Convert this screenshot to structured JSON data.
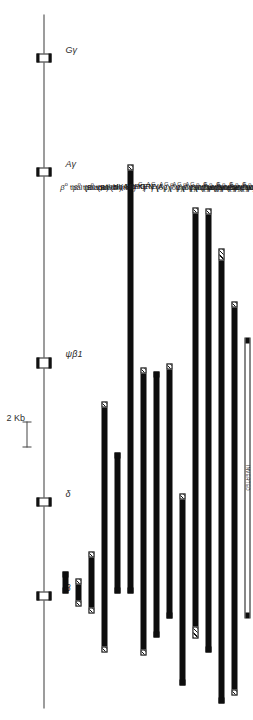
{
  "figure": {
    "scale": {
      "label": "2 Kb",
      "kb": 2
    }
  },
  "axis": {
    "name": "globin-gene-axis",
    "genes": [
      {
        "id": "g-gamma",
        "label": "Gγ",
        "sup": ""
      },
      {
        "id": "a-gamma",
        "label": "Aγ",
        "sup": ""
      },
      {
        "id": "psi-beta1",
        "label": "ψβ1",
        "sup": ""
      },
      {
        "id": "delta",
        "label": "δ",
        "sup": ""
      },
      {
        "id": "beta",
        "label": "β",
        "sup": ""
      }
    ]
  },
  "chart_data": {
    "type": "bar",
    "orientation": "horizontal-rotated",
    "xlabel": "Gene cluster position (kb)",
    "ylabel": "",
    "scale_bar_kb": 2,
    "gene_positions_kb": [
      0.0,
      4.9,
      13.1,
      21.8,
      27.6
    ],
    "gene_names": [
      "Gγ",
      "Aγ",
      "ψβ1",
      "δ",
      "β"
    ],
    "categories": [
      "β° thal (Black)",
      "β° thal (Black)",
      "β° thal (Dutch)",
      "γ thal (Asian)",
      "Hb LEPORE",
      "Hb KENYA",
      "GγAγ(δβ)° thal (Sicilian)",
      "GγAγ(δβ)° thal (Japanese)",
      "GγAγ(δβ)° thal (Black)",
      "GγAγ(δβ)° thal (Greek)",
      "Gγ(Aγδβ)° thal (Turkish)",
      "Gγ(Aγδβ)° thal (Malaysian)",
      "Gγ(Aγδβ)° thal (German)",
      "Gγ(Aγδβ)° thal (Black)",
      "Gγ(Aγδβ)° thal (Indian)"
    ],
    "values_kb": [
      1.6,
      1.2,
      2.6,
      15.1,
      7.6,
      22.9,
      15.4,
      14.2,
      13.6,
      20.6,
      23.4,
      34.8,
      37.7,
      32.6,
      23.2
    ]
  },
  "rows": [
    {
      "name": "row-beta0-thal-black-1",
      "label_html": "<i>β</i><sup>o</sup> thal (Black)",
      "label_text": "β° thal (Black)",
      "start_kb": 25.9,
      "end_kb": 27.5,
      "left_end": "solid",
      "right_end": "solid",
      "style": "filled"
    },
    {
      "name": "row-beta0-thal-black-2",
      "label_html": "<i>β</i><sup>o</sup> thal (Black)",
      "label_text": "β° thal (Black)",
      "start_kb": 26.4,
      "end_kb": 27.6,
      "left_end": "hatch",
      "right_end": "hatch",
      "style": "filled"
    },
    {
      "name": "row-beta0-thal-dutch",
      "label_html": "<i>β</i><sup>o</sup> thal (Dutch)",
      "label_text": "β° thal (Dutch)",
      "start_kb": 25.0,
      "end_kb": 27.6,
      "left_end": "hatch",
      "right_end": "hatch",
      "style": "filled"
    },
    {
      "name": "row-gamma-thal-asian",
      "label_html": "<i>γ</i> thal (Asian)",
      "label_text": "γ thal (Asian)",
      "start_kb": 18.0,
      "end_kb": 33.1,
      "left_end": "hatch",
      "right_end": "hatch",
      "style": "filled"
    },
    {
      "name": "row-hb-lepore",
      "label_html": "Hb LEPORE",
      "label_text": "Hb LEPORE",
      "start_kb": 20.0,
      "end_kb": 27.6,
      "left_end": "solid",
      "right_end": "solid",
      "style": "filled"
    },
    {
      "name": "row-hb-kenya",
      "label_html": "Hb KENYA",
      "label_text": "Hb KENYA",
      "start_kb": 4.7,
      "end_kb": 27.6,
      "left_end": "hatch",
      "right_end": "solid",
      "style": "filled"
    },
    {
      "name": "row-ggag-db-sicilian",
      "label_html": "<sup>G</sup>γ<sup>A</sup>γ (δβ)<sup>o</sup> thal (Sicilian)",
      "label_text": "GγAγ (δβ)° thal (Sicilian)",
      "start_kb": 16.4,
      "end_kb": 31.8,
      "left_end": "hatch",
      "right_end": "hatch",
      "style": "filled"
    },
    {
      "name": "row-ggag-db-japanese",
      "label_html": "<sup>G</sup>γ<sup>A</sup>γ (δβ)<sup>o</sup> thal (Japanese)",
      "label_text": "GγAγ (δβ)° thal (Japanese)",
      "start_kb": 16.6,
      "end_kb": 30.8,
      "left_end": "solid",
      "right_end": "solid",
      "style": "filled"
    },
    {
      "name": "row-ggag-db-black",
      "label_html": "<sup>G</sup>γ<sup>A</sup>γ (δβ)<sup>o</sup> thal (Black)",
      "label_text": "GγAγ (δβ)° thal (Black)",
      "start_kb": 16.2,
      "end_kb": 29.8,
      "left_end": "hatch",
      "right_end": "solid",
      "style": "filled"
    },
    {
      "name": "row-ggag-db-greek",
      "label_html": "<sup>G</sup>γ<sup>A</sup>γ (δβ)<sup>o</sup> thal (Greek)",
      "label_text": "GγAγ (δβ)° thal (Greek)",
      "start_kb": 22.4,
      "end_kb": 43.0,
      "left_end": "hatch",
      "right_end": "solid",
      "style": "filled"
    },
    {
      "name": "row-gg-agdb-turkish",
      "label_html": "<sup>G</sup>γ (<sup>A</sup>γδβ)<sup>o</sup> thal (Turkish)",
      "label_text": "Gγ (Aγδβ)° thal (Turkish)",
      "start_kb": 7.0,
      "end_kb": 30.4,
      "left_end": "hatch",
      "right_end": "hatch-long",
      "style": "filled"
    },
    {
      "name": "row-gg-agdb-malaysian",
      "label_html": "<sup>G</sup>γ (<sup>A</sup>γδβ)<sup>o</sup> thal (Malaysian)",
      "label_text": "Gγ (Aγδβ)° thal (Malaysian)",
      "start_kb": 7.0,
      "end_kb": 41.8,
      "left_end": "hatch",
      "right_end": "solid",
      "style": "filled"
    },
    {
      "name": "row-gg-agdb-german",
      "label_html": "<sup>G</sup>γ (<sup>A</sup>γδβ)<sup>o</sup> thal (German)",
      "label_text": "Gγ (Aγδβ)° thal (German)",
      "start_kb": 9.2,
      "end_kb": 46.9,
      "left_end": "hatch-long",
      "right_end": "solid",
      "style": "filled"
    },
    {
      "name": "row-gg-agdb-black",
      "label_html": "<sup>G</sup>γ (<sup>A</sup>γδβ)<sup>o</sup> thal (Black)",
      "label_text": "Gγ (Aγδβ)° thal (Black)",
      "start_kb": 12.1,
      "end_kb": 44.7,
      "left_end": "hatch",
      "right_end": "hatch",
      "style": "filled"
    },
    {
      "name": "row-gg-agdb-indian",
      "label_html": "<sup>G</sup>γ (<sup>A</sup>γδβ)<sup>o</sup> thal (Indian)",
      "label_text": "Gγ (Aγδβ)° thal (Indian)",
      "start_kb": 14.0,
      "end_kb": 37.2,
      "left_end": "solid",
      "right_end": "solid",
      "style": "inverted",
      "inner_text": "INVERTED"
    }
  ]
}
